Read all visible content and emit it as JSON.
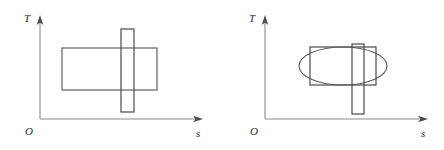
{
  "figure": {
    "title": "",
    "background_color": "#ffffff",
    "stroke_color": "#5a5a5a",
    "axis_color": "#8a8a8a",
    "label_color": "#2b2b2b",
    "panels": [
      {
        "id": "left-panel",
        "name": "ts-diagram-left",
        "axes": {
          "y_label": "T",
          "x_label": "s",
          "origin_label": "O",
          "origin": {
            "x": 40,
            "y": 119
          },
          "y_axis_top": {
            "x": 40,
            "y": 18
          },
          "x_axis_right": {
            "x": 203,
            "y": 119
          }
        },
        "shapes": [
          {
            "name": "wide-rectangle",
            "type": "rect",
            "x": 62,
            "y": 48,
            "width": 95,
            "height": 42
          },
          {
            "name": "narrow-vertical-rectangle",
            "type": "rect",
            "x": 121,
            "y": 29,
            "width": 13,
            "height": 83
          }
        ]
      },
      {
        "id": "right-panel",
        "name": "ts-diagram-right",
        "axes": {
          "y_label": "T",
          "x_label": "s",
          "origin_label": "O",
          "origin": {
            "x": 265,
            "y": 119
          },
          "y_axis_top": {
            "x": 265,
            "y": 18
          },
          "x_axis_right": {
            "x": 428,
            "y": 119
          }
        },
        "shapes": [
          {
            "name": "enclosing-rectangle",
            "type": "rect",
            "x": 310,
            "y": 47,
            "width": 66,
            "height": 38
          },
          {
            "name": "ellipse",
            "type": "ellipse",
            "cx": 343,
            "cy": 66,
            "rx": 44,
            "ry": 19
          },
          {
            "name": "narrow-vertical-rectangle",
            "type": "rect",
            "x": 352,
            "y": 44,
            "width": 12,
            "height": 70
          }
        ]
      }
    ]
  }
}
